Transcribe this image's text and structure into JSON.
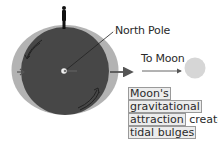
{
  "labels": {
    "north_pole": "North Pole",
    "to_moon": "To Moon"
  },
  "caption": {
    "line1": "Moon's",
    "line2": "gravitational",
    "line3_boxed": "attraction",
    "line3_plain": "creates",
    "line4": "tidal bulges"
  },
  "colors": {
    "earth": "#474747",
    "tidal_bulge": "#b3b3b3",
    "moon": "#d6d6d6",
    "arrow": "#555555",
    "background": "#ffffff"
  },
  "icons": {
    "person": "person-silhouette",
    "rotation_arrows": "curved-arrow",
    "center_pole": "pole-point"
  }
}
